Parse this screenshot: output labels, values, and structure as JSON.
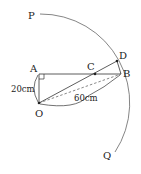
{
  "diagram": {
    "points": {
      "P": {
        "label": "P"
      },
      "Q": {
        "label": "Q"
      },
      "A": {
        "label": "A"
      },
      "B": {
        "label": "B"
      },
      "C": {
        "label": "C"
      },
      "D": {
        "label": "D"
      },
      "O": {
        "label": "O"
      }
    },
    "measurements": {
      "OA": "20cm",
      "OB": "60cm"
    },
    "colors": {
      "line": "#333333",
      "arc": "#555555"
    }
  }
}
